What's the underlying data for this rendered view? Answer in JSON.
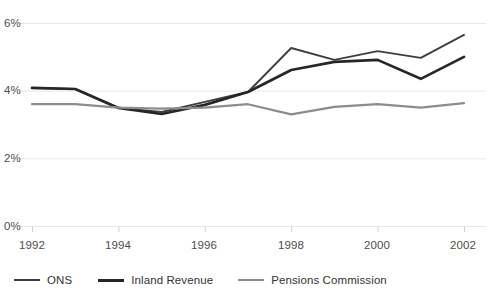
{
  "chart_data": {
    "type": "line",
    "title": "",
    "subtitle": "",
    "xlabel": "",
    "ylabel": "",
    "x": [
      1992,
      1993,
      1994,
      1995,
      1996,
      1997,
      1998,
      1999,
      2000,
      2001,
      2002
    ],
    "xlim": [
      1992,
      2002
    ],
    "ylim": [
      0,
      6
    ],
    "y_ticks": [
      0,
      2,
      4,
      6
    ],
    "y_tick_labels": [
      "0%",
      "2%",
      "4%",
      "6%"
    ],
    "x_ticks": [
      1992,
      1994,
      1996,
      1998,
      2000,
      2002
    ],
    "x_tick_labels": [
      "1992",
      "1994",
      "1996",
      "1998",
      "2000",
      "2002"
    ],
    "grid": "horizontal",
    "legend_position": "bottom-left",
    "series": [
      {
        "name": "ONS",
        "color": "#3f3f3f",
        "width": 1.9,
        "values": [
          4.08,
          4.05,
          3.49,
          3.37,
          3.67,
          3.96,
          5.26,
          4.91,
          5.17,
          4.97,
          5.65
        ]
      },
      {
        "name": "Inland Revenue",
        "color": "#262626",
        "width": 2.7,
        "values": [
          4.08,
          4.05,
          3.49,
          3.31,
          3.58,
          3.96,
          4.61,
          4.85,
          4.91,
          4.35,
          5.0
        ]
      },
      {
        "name": "Pensions Commission",
        "color": "#8c8c8c",
        "width": 2.2,
        "values": [
          3.6,
          3.6,
          3.5,
          3.47,
          3.5,
          3.6,
          3.3,
          3.52,
          3.6,
          3.5,
          3.63
        ]
      }
    ]
  },
  "axis": {
    "y_labels": [
      "6%",
      "4%",
      "2%",
      "0%"
    ],
    "x_labels": [
      "1992",
      "1994",
      "1996",
      "1998",
      "2000",
      "2002"
    ]
  },
  "legend": {
    "items": [
      {
        "label": "ONS",
        "color": "#3f3f3f"
      },
      {
        "label": "Inland Revenue",
        "color": "#262626"
      },
      {
        "label": "Pensions Commission",
        "color": "#8c8c8c"
      }
    ]
  },
  "style": {
    "background": "#ffffff",
    "gridline_color": "#e8e8e8",
    "axis_text_color": "#4d4d4d",
    "legend_text_color": "#333333"
  }
}
